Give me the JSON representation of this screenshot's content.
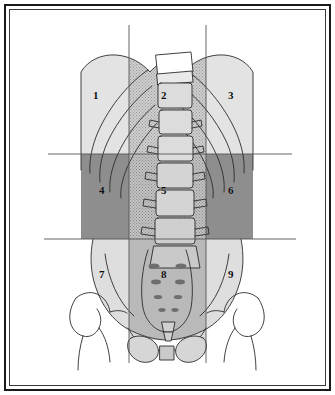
{
  "figure": {
    "type": "anatomical-line-diagram",
    "frame": {
      "style": "double-rule-rectangular-border",
      "color": "#1a1a1a"
    },
    "background_color": "#ffffff",
    "ink_color": "#2b2b2b"
  },
  "grid": {
    "description": "Two vertical midclavicular lines and two horizontal planes divide the abdomen into nine regions",
    "line_color": "#555555",
    "vertical_lines": [
      {
        "name": "left-vertical-line",
        "x": 129,
        "y_start": 25,
        "y_end": 363
      },
      {
        "name": "right-vertical-line",
        "x": 206,
        "y_start": 25,
        "y_end": 363
      }
    ],
    "horizontal_lines": [
      {
        "name": "upper-horizontal-line",
        "y": 154,
        "x_start": 48,
        "x_end": 292
      },
      {
        "name": "lower-horizontal-line",
        "y": 239,
        "x_start": 44,
        "x_end": 296
      }
    ]
  },
  "regions": [
    {
      "number": "1",
      "row": "upper",
      "column": "right-of-patient",
      "label_x": 96,
      "label_y": 95,
      "shade": "#e0e0e0"
    },
    {
      "number": "2",
      "row": "upper",
      "column": "middle",
      "label_x": 164,
      "label_y": 95,
      "shade": "#d6d6d6"
    },
    {
      "number": "3",
      "row": "upper",
      "column": "left-of-patient",
      "label_x": 231,
      "label_y": 95,
      "shade": "#e0e0e0"
    },
    {
      "number": "4",
      "row": "middle",
      "column": "right-of-patient",
      "label_x": 101,
      "label_y": 190,
      "shade": "#8e8e8e"
    },
    {
      "number": "5",
      "row": "middle",
      "column": "middle",
      "label_x": 164,
      "label_y": 190,
      "shade": "#c4c4c4"
    },
    {
      "number": "6",
      "row": "middle",
      "column": "left-of-patient",
      "label_x": 231,
      "label_y": 190,
      "shade": "#8e8e8e"
    },
    {
      "number": "7",
      "row": "lower",
      "column": "right-of-patient",
      "label_x": 101,
      "label_y": 274,
      "shade": "#dcdcdc"
    },
    {
      "number": "8",
      "row": "lower",
      "column": "middle",
      "label_x": 164,
      "label_y": 274,
      "shade": "#bdbdbd"
    },
    {
      "number": "9",
      "row": "lower",
      "column": "left-of-patient",
      "label_x": 231,
      "label_y": 274,
      "shade": "#dcdcdc"
    }
  ],
  "skeletal_elements": [
    {
      "name": "rib-cage",
      "description": "lower costal margins arching from midline down and laterally"
    },
    {
      "name": "lumbar-vertebrae",
      "description": "stacked vertebral bodies with lateral transverse processes"
    },
    {
      "name": "sacrum",
      "description": "triangular sacrum with paired anterior sacral foramina"
    },
    {
      "name": "coccyx",
      "description": "small tapered segment inferior to sacrum"
    },
    {
      "name": "iliac-crest-left",
      "description": "wing of ilium"
    },
    {
      "name": "iliac-crest-right",
      "description": "wing of ilium"
    },
    {
      "name": "pubic-symphysis",
      "description": "midline joint between pubic bones"
    },
    {
      "name": "obturator-foramen-left",
      "description": "oval opening in hip bone"
    },
    {
      "name": "obturator-foramen-right",
      "description": "oval opening in hip bone"
    },
    {
      "name": "femur-head-left",
      "description": "proximal femur with head, neck and greater trochanter"
    },
    {
      "name": "femur-head-right",
      "description": "proximal femur with head, neck and greater trochanter"
    }
  ]
}
